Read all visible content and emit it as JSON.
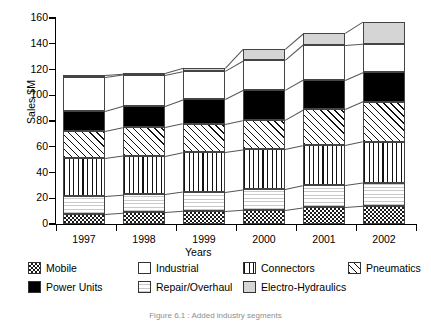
{
  "chart_data": {
    "type": "area",
    "title": "",
    "xlabel": "Years",
    "ylabel": "Sales $M",
    "categories": [
      "1997",
      "1998",
      "1999",
      "2000",
      "2001",
      "2002"
    ],
    "ylim": [
      0,
      160
    ],
    "yticks": [
      0,
      20,
      40,
      60,
      80,
      100,
      120,
      140,
      160
    ],
    "grid": false,
    "legend_position": "bottom",
    "stacked": true,
    "series": [
      {
        "name": "Mobile",
        "pattern": "checkerboard",
        "values": [
          8,
          9,
          10,
          11,
          13,
          14
        ]
      },
      {
        "name": "Repair/Overhaul",
        "pattern": "horizontal-wave",
        "values": [
          14,
          14,
          15,
          16,
          17,
          18
        ]
      },
      {
        "name": "Connectors",
        "pattern": "vertical-stripes",
        "values": [
          29,
          30,
          31,
          31,
          31,
          32
        ]
      },
      {
        "name": "Pneumatics",
        "pattern": "diagonal-hatch",
        "values": [
          21,
          22,
          22,
          23,
          28,
          31
        ]
      },
      {
        "name": "Power Units",
        "pattern": "solid-black",
        "values": [
          16,
          17,
          19,
          23,
          23,
          23
        ]
      },
      {
        "name": "Industrial",
        "pattern": "white",
        "values": [
          26,
          24,
          22,
          23,
          27,
          22
        ]
      },
      {
        "name": "Electro-Hydraulics",
        "pattern": "light-gray",
        "values": [
          2,
          1,
          2,
          9,
          9,
          17
        ]
      }
    ],
    "totals": [
      116,
      117,
      121,
      136,
      148,
      157
    ]
  },
  "legend": {
    "items": [
      {
        "label": "Mobile",
        "pattern": "checkerboard"
      },
      {
        "label": "Industrial",
        "pattern": "white"
      },
      {
        "label": "Connectors",
        "pattern": "vertical-stripes"
      },
      {
        "label": "Pneumatics",
        "pattern": "diagonal-hatch"
      },
      {
        "label": "Power Units",
        "pattern": "solid-black"
      },
      {
        "label": "Repair/Overhaul",
        "pattern": "horizontal-wave"
      },
      {
        "label": "Electro-Hydraulics",
        "pattern": "light-gray"
      }
    ]
  },
  "caption": "Figure 6.1 : Added industry segments"
}
